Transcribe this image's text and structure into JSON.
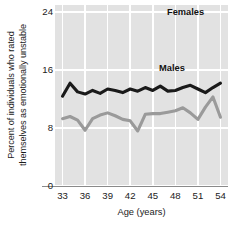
{
  "chart_data": {
    "type": "line",
    "title": "",
    "xlabel": "Age (years)",
    "ylabel": "Percent of individuals who rated themselves as emotionally unstable",
    "ylabel_lines": [
      "Percent of individuals who rated",
      "themselves as emotionally unstable"
    ],
    "xlim": [
      32,
      55
    ],
    "ylim": [
      0,
      25
    ],
    "yticks": [
      0,
      8,
      16,
      24
    ],
    "ytick_labels": [
      "0",
      "8",
      "16",
      "24"
    ],
    "xticks": [
      33,
      36,
      39,
      42,
      45,
      48,
      51,
      54
    ],
    "xtick_labels": [
      "33",
      "36",
      "39",
      "42",
      "45",
      "48",
      "51",
      "54"
    ],
    "grid": "white gridlines on gray panel, vertical at each x tick, horizontal at each y tick",
    "legend_position": "inline annotations at right of each series",
    "plot_background": "#e2e2e2",
    "gridline_color": "#ffffff",
    "x": [
      33,
      34,
      35,
      36,
      37,
      38,
      39,
      40,
      41,
      42,
      43,
      44,
      45,
      46,
      47,
      48,
      49,
      50,
      51,
      52,
      53,
      54
    ],
    "series": [
      {
        "name": "Females",
        "color": "#1a1a1a",
        "values": [
          12.4,
          14.2,
          13.0,
          12.7,
          13.2,
          12.8,
          13.4,
          13.2,
          12.9,
          13.4,
          13.1,
          13.6,
          13.2,
          13.8,
          13.1,
          13.2,
          13.6,
          13.9,
          13.4,
          12.9,
          13.6,
          14.2
        ]
      },
      {
        "name": "Males",
        "color": "#9a9a9a",
        "values": [
          9.3,
          9.6,
          9.1,
          7.7,
          9.3,
          9.8,
          10.1,
          9.7,
          9.2,
          9.0,
          7.6,
          9.9,
          10.0,
          10.0,
          10.2,
          10.4,
          10.8,
          10.1,
          9.2,
          10.9,
          12.3,
          9.5
        ]
      }
    ],
    "annotations": [
      {
        "text": "Females",
        "series": "Females"
      },
      {
        "text": "Males",
        "series": "Males"
      }
    ]
  },
  "axis": {
    "y_title_line1": "Percent of individuals who rated",
    "y_title_line2": "themselves as emotionally unstable",
    "x_title": "Age (years)"
  },
  "colors": {
    "panel": "#e2e2e2",
    "grid": "#ffffff",
    "females_line": "#1a1a1a",
    "males_line": "#9a9a9a",
    "axis_line": "#8a8a8a",
    "text": "#1b1b1b"
  }
}
